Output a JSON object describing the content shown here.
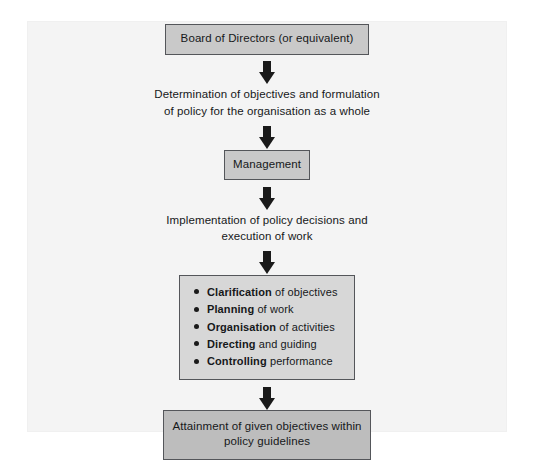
{
  "diagram": {
    "colors": {
      "box_fill": "#c9c9c9",
      "bullets_fill": "#d7d7d7",
      "final_fill": "#bdbdbd",
      "border": "#54565a",
      "arrow": "#1a1a1a",
      "page": "#f4f4f4",
      "text": "#16181a"
    },
    "nodes": {
      "board": {
        "label": "Board of Directors (or equivalent)"
      },
      "determination": {
        "line1": "Determination of objectives and formulation",
        "line2": "of policy for the organisation as a whole"
      },
      "management": {
        "label": "Management"
      },
      "implementation": {
        "line1": "Implementation of policy decisions and",
        "line2": "execution of work"
      },
      "activities": {
        "items": [
          {
            "lead": "Clarification",
            "rest": " of objectives"
          },
          {
            "lead": "Planning",
            "rest": " of work"
          },
          {
            "lead": "Organisation",
            "rest": " of activities"
          },
          {
            "lead": "Directing",
            "rest": " and guiding"
          },
          {
            "lead": "Controlling",
            "rest": " performance"
          }
        ]
      },
      "attainment": {
        "line1": "Attainment of given objectives within",
        "line2": "policy guidelines"
      }
    },
    "arrows": {
      "a1": "down-arrow",
      "a2": "down-arrow",
      "a3": "down-arrow",
      "a4": "down-arrow",
      "a5": "down-arrow"
    }
  }
}
